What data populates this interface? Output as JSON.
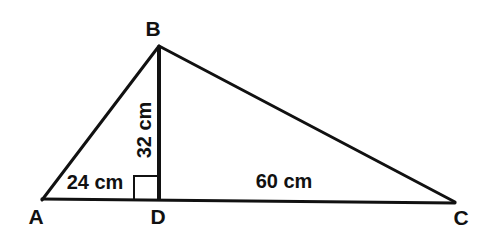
{
  "figure": {
    "kind": "geometry-diagram",
    "background_color": "#ffffff",
    "stroke_color": "#111111",
    "vertices": [
      {
        "id": "A",
        "label": "A",
        "x": 42,
        "y": 200,
        "label_x": 36,
        "label_y": 216
      },
      {
        "id": "B",
        "label": "B",
        "x": 159,
        "y": 46,
        "label_x": 153,
        "label_y": 28
      },
      {
        "id": "C",
        "label": "C",
        "x": 455,
        "y": 202,
        "label_x": 461,
        "label_y": 217
      },
      {
        "id": "D",
        "label": "D",
        "x": 159,
        "y": 200,
        "label_x": 158,
        "label_y": 216
      }
    ],
    "segments": [
      {
        "name": "side-AB",
        "from": "A",
        "to": "B",
        "width": 3
      },
      {
        "name": "side-BC",
        "from": "B",
        "to": "C",
        "width": 3
      },
      {
        "name": "base-AC",
        "from": "A",
        "to": "C",
        "width": 3
      },
      {
        "name": "altitude-BD",
        "from": "B",
        "to": "D",
        "width": 4
      }
    ],
    "right_angle": {
      "at": "D",
      "x": 134,
      "y": 176,
      "size": 24,
      "width": 2
    },
    "measurements": [
      {
        "name": "AD",
        "text": "24 cm",
        "x": 95,
        "y": 182,
        "rotated": false
      },
      {
        "name": "BD",
        "text": "32 cm",
        "x": 144,
        "y": 130,
        "rotated": true
      },
      {
        "name": "DC",
        "text": "60 cm",
        "x": 284,
        "y": 181,
        "rotated": false
      }
    ]
  }
}
